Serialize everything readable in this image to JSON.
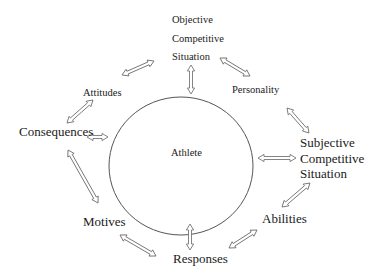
{
  "diagram": {
    "center": {
      "label": "Athlete",
      "shape": "ellipse",
      "cx": 181,
      "cy": 166,
      "rx": 72,
      "ry": 69
    },
    "nodes": {
      "objective_situation": {
        "lines": [
          "Objective",
          "Competitive",
          "Situation"
        ]
      },
      "attitudes": {
        "label": "Attitudes"
      },
      "personality": {
        "label": "Personality"
      },
      "consequences": {
        "label": "Consequences"
      },
      "subjective_situation": {
        "lines": [
          "Subjective",
          "Competitive",
          "Situation"
        ]
      },
      "abilities": {
        "label": "Abilities"
      },
      "motives": {
        "label": "Motives"
      },
      "responses": {
        "label": "Responses"
      }
    },
    "connections": [
      {
        "from": "Objective Competitive Situation",
        "to": "Attitudes",
        "type": "double-arrow"
      },
      {
        "from": "Objective Competitive Situation",
        "to": "Athlete",
        "type": "double-arrow"
      },
      {
        "from": "Objective Competitive Situation",
        "to": "Personality",
        "type": "double-arrow"
      },
      {
        "from": "Personality",
        "to": "Subjective Competitive Situation",
        "type": "double-arrow"
      },
      {
        "from": "Attitudes",
        "to": "Consequences",
        "type": "double-arrow"
      },
      {
        "from": "Consequences",
        "to": "Athlete",
        "type": "double-arrow"
      },
      {
        "from": "Athlete",
        "to": "Subjective Competitive Situation",
        "type": "double-arrow"
      },
      {
        "from": "Consequences",
        "to": "Motives",
        "type": "double-arrow"
      },
      {
        "from": "Subjective Competitive Situation",
        "to": "Abilities",
        "type": "double-arrow"
      },
      {
        "from": "Abilities",
        "to": "Responses",
        "type": "double-arrow"
      },
      {
        "from": "Motives",
        "to": "Responses",
        "type": "double-arrow"
      },
      {
        "from": "Athlete",
        "to": "Responses",
        "type": "double-arrow"
      }
    ],
    "colors": {
      "stroke": "#555555",
      "text": "#1a1a1a",
      "background": "#ffffff"
    }
  }
}
